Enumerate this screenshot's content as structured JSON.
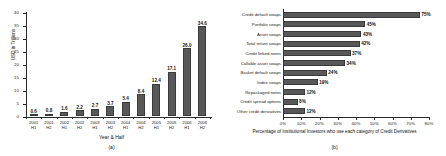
{
  "figure": {
    "panel_a_caption": "(a)",
    "panel_b_caption": "(b)"
  },
  "chart_data": [
    {
      "type": "bar",
      "panel": "(a)",
      "title": "",
      "xlabel": "Year & Half",
      "ylabel": "USD in Trillions",
      "ylim": [
        0,
        40
      ],
      "yticks": [
        0,
        5,
        10,
        15,
        20,
        25,
        30,
        35,
        40
      ],
      "ytick_labels": [
        "0",
        "5",
        "10",
        "15",
        "20",
        "25",
        "30",
        "35",
        "40"
      ],
      "grid": false,
      "orientation": "vertical",
      "categories": [
        "2001 H1",
        "2001 H2",
        "2002 H1",
        "2002 H2",
        "2003 H1",
        "2003 H2",
        "2004 H1",
        "2004 H2",
        "2005 H1",
        "2005 H2",
        "2006 H1",
        "2006 H2"
      ],
      "category_lines": [
        [
          "2001",
          "H1"
        ],
        [
          "2001",
          "H2"
        ],
        [
          "2002",
          "H1"
        ],
        [
          "2002",
          "H2"
        ],
        [
          "2003",
          "H1"
        ],
        [
          "2003",
          "H2"
        ],
        [
          "2004",
          "H1"
        ],
        [
          "2004",
          "H2"
        ],
        [
          "2005",
          "H1"
        ],
        [
          "2005",
          "H2"
        ],
        [
          "2006",
          "H1"
        ],
        [
          "2006",
          "H2"
        ]
      ],
      "values": [
        0.6,
        0.8,
        1.6,
        2.2,
        2.7,
        3.7,
        5.4,
        8.4,
        12.4,
        17.1,
        26.0,
        34.6
      ],
      "value_labels": [
        "0.6",
        "0.8",
        "1.6",
        "2.2",
        "2.7",
        "3.7",
        "5.4",
        "8.4",
        "12.4",
        "17.1",
        "26.0",
        "34.6"
      ],
      "bar_color": "#585858"
    },
    {
      "type": "bar",
      "panel": "(b)",
      "title": "",
      "xlabel": "Percentage of Institutional Investors who use each category of Credit Derivatives",
      "ylabel": "",
      "xlim": [
        0,
        80
      ],
      "xticks": [
        0,
        10,
        20,
        30,
        40,
        50,
        60,
        70,
        80
      ],
      "xtick_labels": [
        "0%",
        "10%",
        "20%",
        "30%",
        "40%",
        "50%",
        "60%",
        "70%",
        "80%"
      ],
      "grid": false,
      "orientation": "horizontal",
      "categories": [
        "Credit default swaps",
        "Portfolio swaps",
        "Asset swaps",
        "Total return swaps",
        "Credit linked notes",
        "Callable asset swaps",
        "Basket default swaps",
        "Index swaps",
        "Repackaged notes",
        "Credit spread options",
        "Other credit derivatives"
      ],
      "values": [
        75,
        45,
        43,
        42,
        37,
        34,
        24,
        19,
        12,
        8,
        12
      ],
      "value_labels": [
        "75%",
        "45%",
        "43%",
        "42%",
        "37%",
        "34%",
        "24%",
        "19%",
        "12%",
        "8%",
        "12%"
      ],
      "bar_color": "#585858"
    }
  ]
}
